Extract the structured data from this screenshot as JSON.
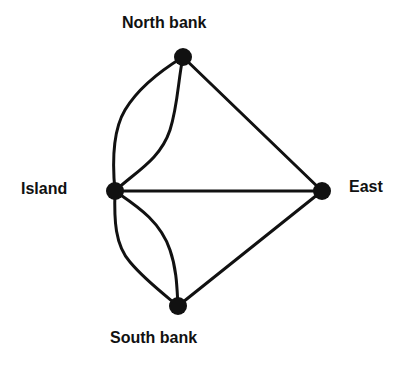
{
  "colors": {
    "line": "#111111",
    "node": "#111111",
    "background": "#ffffff"
  },
  "nodes": [
    {
      "id": "north",
      "label": "North bank",
      "x": 183,
      "y": 57
    },
    {
      "id": "island",
      "label": "Island",
      "x": 115,
      "y": 191
    },
    {
      "id": "east",
      "label": "East",
      "x": 322,
      "y": 191
    },
    {
      "id": "south",
      "label": "South bank",
      "x": 178,
      "y": 306
    }
  ],
  "edges": [
    {
      "from": "island",
      "to": "north",
      "shape": "outer-curve"
    },
    {
      "from": "island",
      "to": "north",
      "shape": "inner-curve"
    },
    {
      "from": "island",
      "to": "south",
      "shape": "outer-curve"
    },
    {
      "from": "island",
      "to": "south",
      "shape": "inner-curve"
    },
    {
      "from": "island",
      "to": "east",
      "shape": "straight"
    },
    {
      "from": "north",
      "to": "east",
      "shape": "straight"
    },
    {
      "from": "south",
      "to": "east",
      "shape": "straight"
    }
  ]
}
